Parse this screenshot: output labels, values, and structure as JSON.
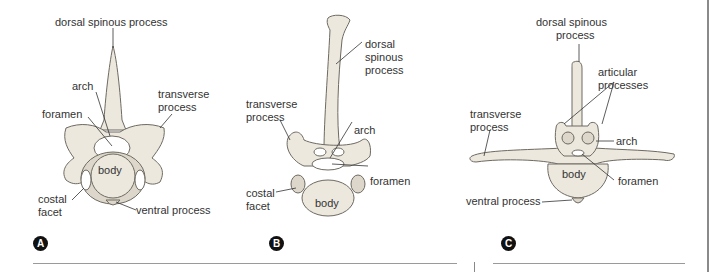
{
  "figure": {
    "panels": [
      {
        "id": "A",
        "badge": "A",
        "labels": {
          "dorsal_spinous_process": "dorsal spinous process",
          "arch": "arch",
          "transverse_process_1": "transverse",
          "transverse_process_2": "process",
          "foramen": "foramen",
          "body": "body",
          "costal_facet_1": "costal",
          "costal_facet_2": "facet",
          "ventral_process": "ventral process"
        }
      },
      {
        "id": "B",
        "badge": "B",
        "labels": {
          "dorsal_spinous_process_1": "dorsal",
          "dorsal_spinous_process_2": "spinous",
          "dorsal_spinous_process_3": "process",
          "transverse_process_1": "transverse",
          "transverse_process_2": "process",
          "arch": "arch",
          "foramen": "foramen",
          "costal_facet_1": "costal",
          "costal_facet_2": "facet",
          "body": "body"
        }
      },
      {
        "id": "C",
        "badge": "C",
        "labels": {
          "dorsal_spinous_process_1": "dorsal spinous",
          "dorsal_spinous_process_2": "process",
          "articular_processes_1": "articular",
          "articular_processes_2": "processes",
          "transverse_process_1": "transverse",
          "transverse_process_2": "process",
          "arch": "arch",
          "body": "body",
          "foramen": "foramen",
          "ventral_process": "ventral process"
        }
      }
    ]
  }
}
